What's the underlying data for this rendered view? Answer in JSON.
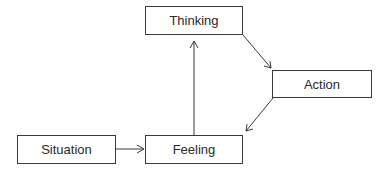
{
  "diagram": {
    "nodes": [
      {
        "id": "thinking",
        "label": "Thinking"
      },
      {
        "id": "action",
        "label": "Action"
      },
      {
        "id": "situation",
        "label": "Situation"
      },
      {
        "id": "feeling",
        "label": "Feeling"
      }
    ],
    "edges": [
      {
        "from": "situation",
        "to": "feeling"
      },
      {
        "from": "feeling",
        "to": "thinking"
      },
      {
        "from": "thinking",
        "to": "action"
      },
      {
        "from": "action",
        "to": "feeling"
      }
    ],
    "colors": {
      "stroke": "#3a3a3a",
      "text": "#2a2a2a",
      "background": "#ffffff"
    }
  }
}
